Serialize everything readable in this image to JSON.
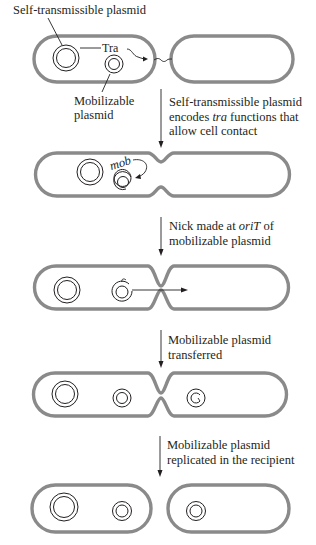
{
  "figure": {
    "type": "conjugation-mobilization-schematic",
    "labels": {
      "self_transmissible_plasmid": "Self-transmissible plasmid",
      "tra": "Tra",
      "mobilizable_plasmid_line1": "Mobilizable",
      "mobilizable_plasmid_line2": "plasmid",
      "mob": "mob"
    },
    "steps": [
      {
        "line1": "Self-transmissible plasmid",
        "line2_pre": "encodes ",
        "line2_italic": "tra",
        "line2_post": " functions that",
        "line3": "allow cell contact"
      },
      {
        "line1_pre": "Nick made at ",
        "line1_italic": "oriT",
        "line1_post": " of",
        "line2": "mobilizable plasmid"
      },
      {
        "line1": "Mobilizable plasmid",
        "line2": "transferred"
      },
      {
        "line1": "Mobilizable plasmid",
        "line2": "replicated in the recipient"
      }
    ],
    "colors": {
      "cell_membrane": "#8a8a8a",
      "plasmid_stroke": "#231f20",
      "text": "#231f20",
      "background": "#ffffff"
    }
  }
}
